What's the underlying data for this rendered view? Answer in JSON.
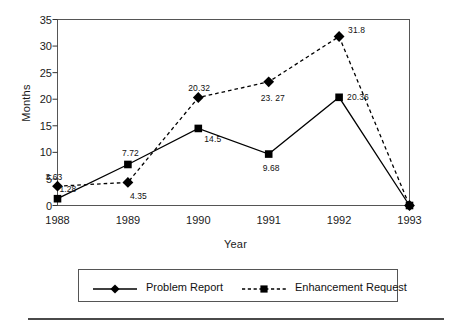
{
  "chart_data": {
    "type": "line",
    "title": "",
    "xlabel": "Year",
    "ylabel": "Months",
    "categories": [
      "1988",
      "1989",
      "1990",
      "1991",
      "1992",
      "1993"
    ],
    "xlim": [
      1988,
      1993
    ],
    "ylim": [
      0,
      35
    ],
    "yticks": [
      "0",
      "5",
      "10",
      "15",
      "20",
      "25",
      "30",
      "35"
    ],
    "ytick_values": [
      0,
      5,
      10,
      15,
      20,
      25,
      30,
      35
    ],
    "grid": false,
    "legend_position": "bottom",
    "series": [
      {
        "name": "Problem Report",
        "line_style": "solid",
        "legend_marker": "diamond",
        "plotted_marker": "square",
        "color": "#000000",
        "values": [
          1.28,
          7.72,
          14.5,
          9.68,
          20.36,
          0
        ],
        "labels": [
          "1.28",
          "7.72",
          "14.5",
          "9.68",
          "20.36",
          ""
        ]
      },
      {
        "name": "Enhancement Request",
        "line_style": "dashed",
        "legend_marker": "square",
        "plotted_marker": "diamond",
        "color": "#000000",
        "values": [
          3.63,
          4.35,
          20.32,
          23.27,
          31.8,
          0
        ],
        "labels": [
          "3.63",
          "4.35",
          "20.32",
          "23. 27",
          "31.8",
          ""
        ]
      }
    ]
  },
  "legend": {
    "items": [
      {
        "label": "Problem Report"
      },
      {
        "label": "Enhancement Request"
      }
    ]
  }
}
